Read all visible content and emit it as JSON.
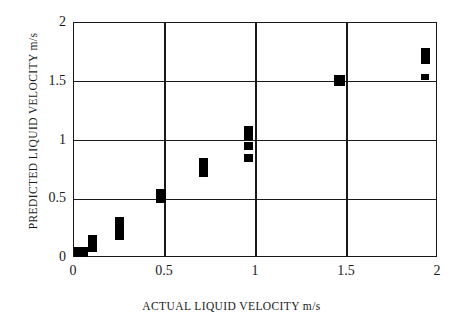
{
  "chart_data": {
    "type": "scatter",
    "title": "",
    "xlabel": "ACTUAL LIQUID VELOCITY m/s",
    "ylabel": "PREDICTED LIQUID VELOCITY m/s",
    "xlim": [
      0,
      2
    ],
    "ylim": [
      0,
      2
    ],
    "xticks": [
      0,
      0.5,
      1,
      1.5,
      2
    ],
    "yticks": [
      0,
      0.5,
      1,
      1.5,
      2
    ],
    "xtick_labels": [
      "0",
      "0.5",
      "1",
      "1.5",
      "2"
    ],
    "ytick_labels": [
      "0",
      "0.5",
      "1",
      "1.5",
      "2"
    ],
    "grid": true,
    "legend": "none",
    "marker_color": "#000000",
    "marker_style": "filled-rectangle",
    "points": [
      {
        "x": 0.04,
        "y": 0.05,
        "w": 0.075,
        "h": 0.09
      },
      {
        "x": 0.1,
        "y": 0.1,
        "w": 0.05,
        "h": 0.09
      },
      {
        "x": 0.1,
        "y": 0.17,
        "w": 0.05,
        "h": 0.06
      },
      {
        "x": 0.25,
        "y": 0.23,
        "w": 0.05,
        "h": 0.15
      },
      {
        "x": 0.25,
        "y": 0.32,
        "w": 0.05,
        "h": 0.05
      },
      {
        "x": 0.48,
        "y": 0.53,
        "w": 0.055,
        "h": 0.12
      },
      {
        "x": 0.71,
        "y": 0.76,
        "w": 0.05,
        "h": 0.14
      },
      {
        "x": 0.71,
        "y": 0.83,
        "w": 0.05,
        "h": 0.05
      },
      {
        "x": 0.96,
        "y": 1.06,
        "w": 0.05,
        "h": 0.12
      },
      {
        "x": 0.96,
        "y": 0.95,
        "w": 0.05,
        "h": 0.07
      },
      {
        "x": 0.96,
        "y": 0.85,
        "w": 0.05,
        "h": 0.07
      },
      {
        "x": 1.46,
        "y": 1.51,
        "w": 0.06,
        "h": 0.09
      },
      {
        "x": 1.93,
        "y": 1.7,
        "w": 0.05,
        "h": 0.1
      },
      {
        "x": 1.93,
        "y": 1.76,
        "w": 0.05,
        "h": 0.05
      },
      {
        "x": 1.93,
        "y": 1.54,
        "w": 0.045,
        "h": 0.055
      }
    ]
  }
}
